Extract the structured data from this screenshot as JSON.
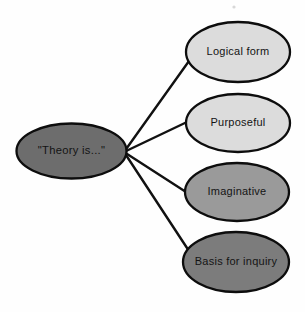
{
  "diagram": {
    "type": "radial-concept-map",
    "background_color": "#fefefe",
    "stroke_color": "#0d0d0d",
    "hub": {
      "label": "\"Theory is...\"",
      "fill": "#6d6d6d",
      "cx": 71.5,
      "cy": 151,
      "rx": 55,
      "ry": 27.5
    },
    "hub_anchor": {
      "x": 124,
      "y": 152
    },
    "branches": [
      {
        "label": "Logical form",
        "fill": "#dcdcdc",
        "cx": 238,
        "cy": 52,
        "rx": 52,
        "ry": 30,
        "line_end": {
          "x": 189,
          "y": 61
        }
      },
      {
        "label": "Purposeful",
        "fill": "#dcdcdc",
        "cx": 238,
        "cy": 123,
        "rx": 52,
        "ry": 29,
        "line_end": {
          "x": 187,
          "y": 122
        }
      },
      {
        "label": "Imaginative",
        "fill": "#9a9a9a",
        "cx": 237,
        "cy": 192,
        "rx": 52,
        "ry": 29,
        "line_end": {
          "x": 186,
          "y": 192
        }
      },
      {
        "label": "Basis for inquiry",
        "fill": "#7c7c7c",
        "cx": 236,
        "cy": 262,
        "rx": 53,
        "ry": 30,
        "line_end": {
          "x": 189,
          "y": 251
        }
      }
    ]
  }
}
